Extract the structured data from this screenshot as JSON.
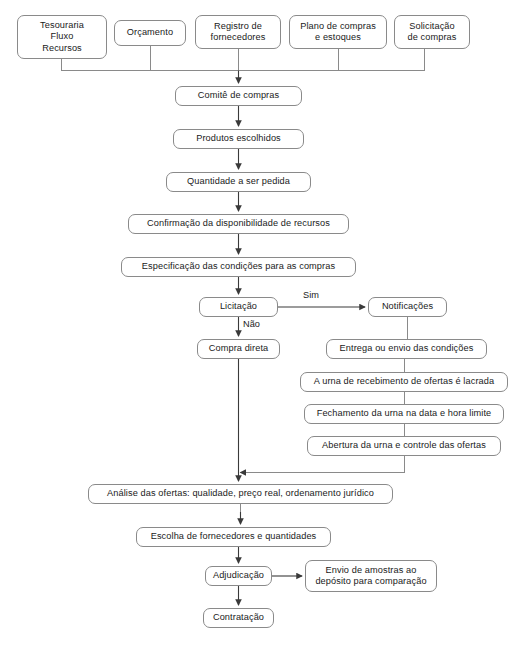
{
  "diagram": {
    "line_color": "#8a8a8a",
    "arrow_color": "#3a3a3a",
    "text_color": "#1a1a1a",
    "background": "#ffffff",
    "nodes": [
      {
        "id": "tesouraria",
        "label": "Tesouraria\nFluxo\nRecursos",
        "x": 17,
        "y": 15,
        "w": 90,
        "h": 44
      },
      {
        "id": "orcamento",
        "label": "Orçamento",
        "x": 114,
        "y": 20,
        "w": 72,
        "h": 26
      },
      {
        "id": "registro",
        "label": "Registro de\nfornecedores",
        "x": 195,
        "y": 15,
        "w": 86,
        "h": 34
      },
      {
        "id": "plano",
        "label": "Plano de compras\ne estoques",
        "x": 289,
        "y": 15,
        "w": 98,
        "h": 34
      },
      {
        "id": "solicitacao",
        "label": "Solicitação\nde compras",
        "x": 394,
        "y": 15,
        "w": 76,
        "h": 34
      },
      {
        "id": "comite",
        "label": "Comitê de compras",
        "x": 175,
        "y": 86,
        "w": 127,
        "h": 20
      },
      {
        "id": "produtos",
        "label": "Produtos escolhidos",
        "x": 173,
        "y": 129,
        "w": 131,
        "h": 20
      },
      {
        "id": "quantidade",
        "label": "Quantidade a ser pedida",
        "x": 166,
        "y": 172,
        "w": 145,
        "h": 20
      },
      {
        "id": "confirmacao",
        "label": "Confirmação da disponibilidade de recursos",
        "x": 128,
        "y": 214,
        "w": 221,
        "h": 20
      },
      {
        "id": "especificacao",
        "label": "Especificação das condições para as compras",
        "x": 121,
        "y": 257,
        "w": 235,
        "h": 20
      },
      {
        "id": "licitacao",
        "label": "Licitação",
        "x": 199,
        "y": 297,
        "w": 79,
        "h": 20
      },
      {
        "id": "notificacoes",
        "label": "Notificações",
        "x": 368,
        "y": 297,
        "w": 79,
        "h": 20
      },
      {
        "id": "compra-direta",
        "label": "Compra direta",
        "x": 197,
        "y": 339,
        "w": 83,
        "h": 20
      },
      {
        "id": "entrega",
        "label": "Entrega ou envio das condições",
        "x": 326,
        "y": 339,
        "w": 161,
        "h": 20
      },
      {
        "id": "urna-lacrada",
        "label": "A urna de recebimento de ofertas é lacrada",
        "x": 300,
        "y": 372,
        "w": 208,
        "h": 20
      },
      {
        "id": "fechamento",
        "label": "Fechamento da urna na data e hora limite",
        "x": 304,
        "y": 404,
        "w": 200,
        "h": 20
      },
      {
        "id": "abertura",
        "label": "Abertura da urna e controle das ofertas",
        "x": 307,
        "y": 436,
        "w": 194,
        "h": 20
      },
      {
        "id": "analise",
        "label": "Análise das ofertas: qualidade, preço real, ordenamento jurídico",
        "x": 88,
        "y": 484,
        "w": 305,
        "h": 20
      },
      {
        "id": "escolha",
        "label": "Escolha de fornecedores e quantidades",
        "x": 136,
        "y": 527,
        "w": 195,
        "h": 20
      },
      {
        "id": "adjudicacao",
        "label": "Adjudicação",
        "x": 205,
        "y": 566,
        "w": 67,
        "h": 20
      },
      {
        "id": "envio-amostras",
        "label": "Envio de amostras ao\ndepósito para comparação",
        "x": 305,
        "y": 560,
        "w": 132,
        "h": 32
      },
      {
        "id": "contratacao",
        "label": "Contratação",
        "x": 203,
        "y": 608,
        "w": 71,
        "h": 20
      }
    ],
    "edge_labels": [
      {
        "id": "sim",
        "text": "Sim",
        "x": 303,
        "y": 290
      },
      {
        "id": "nao",
        "text": "Não",
        "x": 243,
        "y": 319
      }
    ],
    "edges": [
      {
        "from": "tesouraria",
        "to": "bus",
        "type": "stub-down"
      },
      {
        "from": "orcamento",
        "to": "bus",
        "type": "stub-down"
      },
      {
        "from": "registro",
        "to": "bus",
        "type": "stub-down"
      },
      {
        "from": "plano",
        "to": "bus",
        "type": "stub-down"
      },
      {
        "from": "solicitacao",
        "to": "bus",
        "type": "stub-down"
      },
      {
        "from": "bus",
        "to": "comite",
        "type": "arrow-down"
      },
      {
        "from": "comite",
        "to": "produtos",
        "type": "arrow-down"
      },
      {
        "from": "produtos",
        "to": "quantidade",
        "type": "arrow-down"
      },
      {
        "from": "quantidade",
        "to": "confirmacao",
        "type": "arrow-down"
      },
      {
        "from": "confirmacao",
        "to": "especificacao",
        "type": "arrow-down"
      },
      {
        "from": "especificacao",
        "to": "licitacao",
        "type": "arrow-down"
      },
      {
        "from": "licitacao",
        "to": "notificacoes",
        "type": "arrow-right",
        "label": "Sim"
      },
      {
        "from": "licitacao",
        "to": "compra-direta",
        "type": "arrow-down",
        "label": "Não"
      },
      {
        "from": "notificacoes",
        "to": "entrega",
        "type": "line-down"
      },
      {
        "from": "entrega",
        "to": "urna-lacrada",
        "type": "line-down"
      },
      {
        "from": "urna-lacrada",
        "to": "fechamento",
        "type": "line-down"
      },
      {
        "from": "fechamento",
        "to": "abertura",
        "type": "line-down"
      },
      {
        "from": "abertura",
        "to": "analise",
        "type": "elbow-left-arrow"
      },
      {
        "from": "compra-direta",
        "to": "analise",
        "type": "arrow-down"
      },
      {
        "from": "analise",
        "to": "escolha",
        "type": "arrow-down"
      },
      {
        "from": "escolha",
        "to": "adjudicacao",
        "type": "arrow-down"
      },
      {
        "from": "adjudicacao",
        "to": "envio-amostras",
        "type": "arrow-right"
      },
      {
        "from": "adjudicacao",
        "to": "contratacao",
        "type": "arrow-down"
      }
    ]
  }
}
